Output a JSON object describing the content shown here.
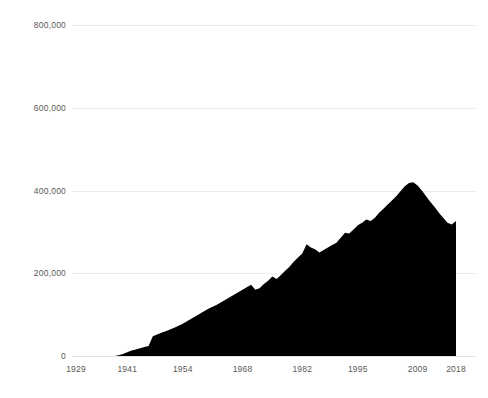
{
  "chart_data": {
    "type": "area",
    "title": "",
    "subtitle": "",
    "xlabel": "",
    "ylabel": "",
    "xlim": [
      1929,
      2018
    ],
    "ylim": [
      0,
      800000
    ],
    "grid": true,
    "legend": "none",
    "series_color": "#000000",
    "grid_color": "#ececed",
    "label_color": "#595959",
    "background": "#ffffff",
    "ytick_labels": [
      "800,000",
      "600,000",
      "400,000",
      "200,000",
      "0"
    ],
    "ytick_values": [
      800000,
      600000,
      400000,
      200000,
      0
    ],
    "xtick_labels": [
      "1929",
      "1941",
      "1954",
      "1968",
      "1982",
      "1995",
      "2009",
      "2018"
    ],
    "xtick_values": [
      1929,
      1941,
      1954,
      1968,
      1982,
      1995,
      2009,
      2018
    ],
    "x": [
      1929,
      1930,
      1931,
      1932,
      1933,
      1934,
      1935,
      1936,
      1937,
      1938,
      1939,
      1940,
      1941,
      1942,
      1943,
      1944,
      1945,
      1946,
      1947,
      1948,
      1949,
      1950,
      1951,
      1952,
      1953,
      1954,
      1955,
      1956,
      1957,
      1958,
      1959,
      1960,
      1961,
      1962,
      1963,
      1964,
      1965,
      1966,
      1967,
      1968,
      1969,
      1970,
      1971,
      1972,
      1973,
      1974,
      1975,
      1976,
      1977,
      1978,
      1979,
      1980,
      1981,
      1982,
      1983,
      1984,
      1985,
      1986,
      1987,
      1988,
      1989,
      1990,
      1991,
      1992,
      1993,
      1994,
      1995,
      1996,
      1997,
      1998,
      1999,
      2000,
      2001,
      2002,
      2003,
      2004,
      2005,
      2006,
      2007,
      2008,
      2009,
      2010,
      2011,
      2012,
      2013,
      2014,
      2015,
      2016,
      2017,
      2018
    ],
    "values": [
      0,
      0,
      0,
      0,
      0,
      0,
      0,
      0,
      0,
      0,
      2000,
      5000,
      9000,
      13000,
      16000,
      19000,
      22000,
      24000,
      48000,
      52000,
      56000,
      60000,
      64000,
      68000,
      73000,
      78000,
      84000,
      90000,
      96000,
      102000,
      108000,
      114000,
      119000,
      124000,
      130000,
      136000,
      142000,
      148000,
      154000,
      160000,
      166000,
      172000,
      160000,
      164000,
      174000,
      182000,
      192000,
      186000,
      196000,
      206000,
      216000,
      228000,
      238000,
      248000,
      270000,
      262000,
      258000,
      250000,
      256000,
      262000,
      268000,
      274000,
      286000,
      298000,
      296000,
      306000,
      316000,
      322000,
      330000,
      326000,
      334000,
      346000,
      356000,
      366000,
      376000,
      386000,
      398000,
      410000,
      418000,
      420000,
      412000,
      400000,
      386000,
      372000,
      360000,
      346000,
      334000,
      322000,
      318000,
      326000
    ]
  },
  "geometry": {
    "plot_left": 76,
    "plot_right": 456,
    "plot_top": 25,
    "plot_bottom": 356,
    "note": "pixel mapping used by the renderer"
  }
}
